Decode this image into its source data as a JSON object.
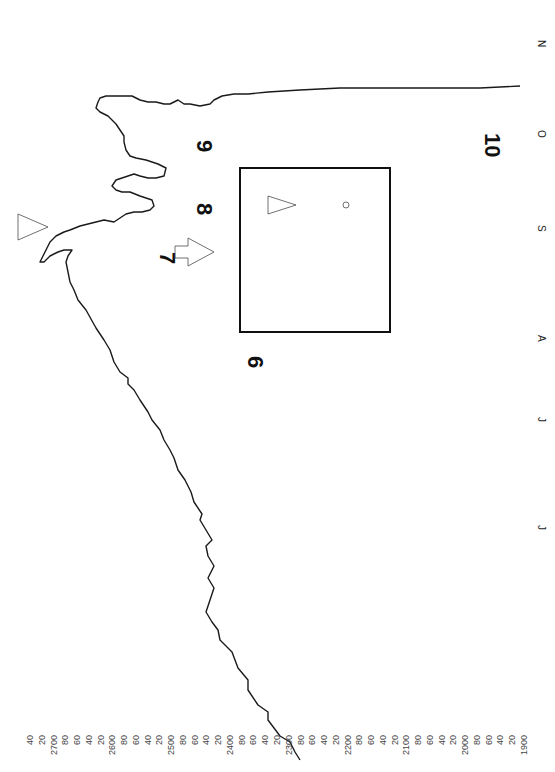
{
  "chart_data": {
    "type": "line",
    "orientation_note": "Chart is printed rotated 90 degrees clockwise: price axis runs horizontally along the bottom, time axis runs vertically on the right (earliest at bottom).",
    "title": "",
    "xlabel": "",
    "ylabel": "",
    "price_axis": {
      "tick_labels": [
        "40",
        "20",
        "2700",
        "80",
        "60",
        "40",
        "20",
        "2600",
        "80",
        "60",
        "40",
        "20",
        "2500",
        "80",
        "60",
        "40",
        "20",
        "2400",
        "80",
        "60",
        "40",
        "20",
        "2300",
        "80",
        "60",
        "40",
        "20",
        "2200",
        "80",
        "60",
        "40",
        "20",
        "2100",
        "80",
        "60",
        "40",
        "20",
        "2000",
        "80",
        "60",
        "40",
        "20",
        "1900"
      ],
      "range_implied": [
        1900,
        2740
      ],
      "major_labels": [
        "2700",
        "2600",
        "2500",
        "2400",
        "2300",
        "2200",
        "2100",
        "2000",
        "1900"
      ]
    },
    "time_axis": {
      "month_labels_bottom_to_top": [
        "J",
        "J",
        "A",
        "S",
        "O",
        "N"
      ]
    },
    "wave_labels": [
      "6",
      "7",
      "8",
      "9",
      "10"
    ],
    "annotations": [
      "AA",
      "x",
      "x",
      "AA",
      "x",
      "AA",
      "x",
      "x",
      "AAL",
      "x",
      "z",
      "AA",
      "x",
      "N",
      "x",
      "x",
      "r",
      "z",
      "c",
      "AAL",
      "x",
      "o"
    ],
    "symbols": [
      "triangle (upper left, near S-O top)",
      "triangle (inside inset box)",
      "block arrow pointing down-right, next to 7"
    ],
    "inset": {
      "description": "Boxed enlargement of the topping formation between wave 7 and 8, with triangle, AAL annotation, x marker and circle marker"
    },
    "grid": false,
    "legend": null,
    "values_note": "No quantitative price series is recorded here: the trace was not measured precisely enough to read values off the axis. See drawing for the approximate pixel geometry only."
  },
  "drawing": {
    "units": "pixels in 555x772 image space, approximate",
    "main_trace": [
      [
        300,
        760
      ],
      [
        295,
        752
      ],
      [
        290,
        742
      ],
      [
        280,
        736
      ],
      [
        268,
        720
      ],
      [
        268,
        712
      ],
      [
        258,
        705
      ],
      [
        248,
        690
      ],
      [
        248,
        680
      ],
      [
        238,
        668
      ],
      [
        232,
        652
      ],
      [
        220,
        640
      ],
      [
        218,
        630
      ],
      [
        212,
        622
      ],
      [
        206,
        612
      ],
      [
        210,
        600
      ],
      [
        214,
        588
      ],
      [
        208,
        578
      ],
      [
        214,
        566
      ],
      [
        208,
        556
      ],
      [
        206,
        546
      ],
      [
        212,
        540
      ],
      [
        206,
        530
      ],
      [
        200,
        520
      ],
      [
        202,
        514
      ],
      [
        194,
        502
      ],
      [
        191,
        492
      ],
      [
        185,
        480
      ],
      [
        178,
        470
      ],
      [
        174,
        458
      ],
      [
        170,
        450
      ],
      [
        164,
        440
      ],
      [
        160,
        430
      ],
      [
        152,
        420
      ],
      [
        148,
        412
      ],
      [
        140,
        400
      ],
      [
        134,
        390
      ],
      [
        128,
        384
      ],
      [
        128,
        378
      ],
      [
        120,
        372
      ],
      [
        114,
        362
      ],
      [
        110,
        350
      ],
      [
        104,
        340
      ],
      [
        96,
        328
      ],
      [
        86,
        310
      ],
      [
        78,
        300
      ],
      [
        74,
        290
      ],
      [
        70,
        282
      ],
      [
        68,
        272
      ],
      [
        66,
        262
      ],
      [
        68,
        256
      ],
      [
        72,
        250
      ],
      [
        64,
        250
      ],
      [
        58,
        252
      ],
      [
        50,
        256
      ],
      [
        44,
        262
      ],
      [
        40,
        262
      ],
      [
        44,
        254
      ],
      [
        50,
        242
      ],
      [
        56,
        236
      ],
      [
        64,
        232
      ],
      [
        70,
        230
      ],
      [
        80,
        226
      ],
      [
        88,
        224
      ],
      [
        96,
        222
      ],
      [
        104,
        220
      ],
      [
        114,
        222
      ],
      [
        120,
        218
      ],
      [
        126,
        214
      ],
      [
        134,
        212
      ],
      [
        142,
        212
      ],
      [
        150,
        210
      ],
      [
        154,
        206
      ],
      [
        152,
        200
      ],
      [
        140,
        196
      ],
      [
        130,
        192
      ],
      [
        122,
        192
      ],
      [
        116,
        190
      ],
      [
        112,
        186
      ],
      [
        116,
        180
      ],
      [
        122,
        178
      ],
      [
        128,
        176
      ],
      [
        134,
        174
      ],
      [
        140,
        176
      ],
      [
        148,
        178
      ],
      [
        156,
        178
      ],
      [
        164,
        176
      ],
      [
        166,
        168
      ],
      [
        158,
        164
      ],
      [
        146,
        160
      ],
      [
        136,
        158
      ],
      [
        130,
        156
      ],
      [
        126,
        150
      ],
      [
        124,
        142
      ],
      [
        124,
        136
      ],
      [
        120,
        130
      ],
      [
        116,
        124
      ],
      [
        112,
        120
      ],
      [
        108,
        116
      ],
      [
        100,
        112
      ],
      [
        96,
        108
      ],
      [
        98,
        102
      ],
      [
        100,
        98
      ],
      [
        106,
        96
      ],
      [
        114,
        96
      ],
      [
        124,
        96
      ],
      [
        132,
        96
      ],
      [
        140,
        100
      ],
      [
        148,
        102
      ],
      [
        156,
        102
      ],
      [
        164,
        104
      ],
      [
        170,
        104
      ],
      [
        178,
        100
      ],
      [
        184,
        104
      ],
      [
        190,
        104
      ],
      [
        200,
        106
      ],
      [
        210,
        104
      ],
      [
        214,
        100
      ],
      [
        222,
        96
      ],
      [
        234,
        94
      ],
      [
        248,
        94
      ],
      [
        268,
        92
      ],
      [
        300,
        90
      ],
      [
        340,
        88
      ],
      [
        390,
        88
      ],
      [
        440,
        88
      ],
      [
        480,
        88
      ],
      [
        520,
        86
      ]
    ],
    "inset_box": {
      "x": 240,
      "y": 168,
      "w": 150,
      "h": 164
    },
    "labels_px": {
      "6": [
        248,
        356
      ],
      "7": [
        160,
        252
      ],
      "8": [
        197,
        203
      ],
      "9": [
        197,
        140
      ],
      "10": [
        485,
        133
      ]
    }
  }
}
